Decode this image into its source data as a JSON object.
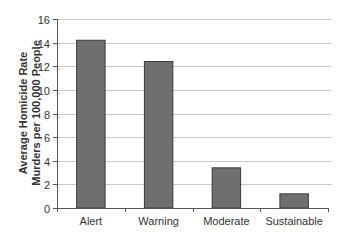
{
  "chart_data": {
    "type": "bar",
    "title": "",
    "xlabel": "",
    "ylabel": [
      "Average Homicide Rate",
      "Murders per 100,000 People"
    ],
    "categories": [
      "Alert",
      "Warning",
      "Moderate",
      "Sustainable"
    ],
    "values": [
      14.2,
      12.4,
      3.4,
      1.2
    ],
    "ylim": [
      0,
      16
    ],
    "yticks": [
      "0",
      "2",
      "4",
      "6",
      "8",
      "10",
      "12",
      "14",
      "16"
    ],
    "grid": true,
    "legend": "none",
    "colors": {
      "bar_fill": "#6f6f6f",
      "bar_edge": "#3c3c3c",
      "grid": "#c9c9c9",
      "axis": "#555555"
    }
  }
}
